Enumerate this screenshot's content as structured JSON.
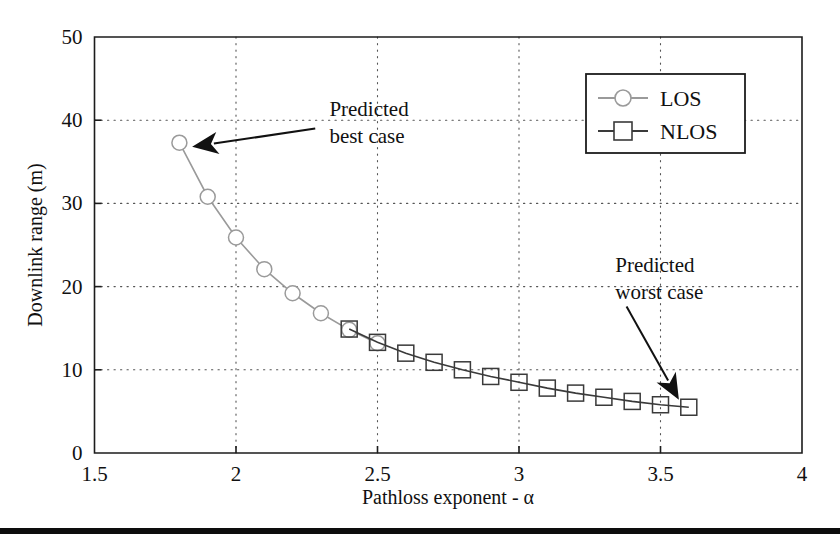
{
  "figure": {
    "background_color": "#ffffff",
    "frame_color": "#1c1c1c",
    "grid_color": "#565656",
    "footer_rule_color": "#0d0d0d"
  },
  "chart_data": {
    "type": "line",
    "title": "",
    "subtitle": "",
    "xlabel": "Pathloss exponent - α",
    "ylabel": "Downlink range (m)",
    "xlim": [
      1.5,
      4
    ],
    "ylim": [
      0,
      50
    ],
    "xticks": [
      1.5,
      2,
      2.5,
      3,
      3.5,
      4
    ],
    "xticklabels": [
      "1.5",
      "2",
      "2.5",
      "3",
      "3.5",
      "4"
    ],
    "yticks": [
      0,
      10,
      20,
      30,
      40,
      50
    ],
    "yticklabels": [
      "0",
      "10",
      "20",
      "30",
      "40",
      "50"
    ],
    "grid": true,
    "grid_style": "dotted",
    "legend_position": "upper-right",
    "series": [
      {
        "name": "LOS",
        "marker": "circle",
        "color": "#9a9a9a",
        "x": [
          1.8,
          1.9,
          2.0,
          2.1,
          2.2,
          2.3,
          2.4,
          2.5
        ],
        "values": [
          37.3,
          30.8,
          25.9,
          22.1,
          19.2,
          16.8,
          14.8,
          13.2
        ]
      },
      {
        "name": "NLOS",
        "marker": "square",
        "color": "#3a3a3a",
        "x": [
          2.4,
          2.5,
          2.6,
          2.7,
          2.8,
          2.9,
          3.0,
          3.1,
          3.2,
          3.3,
          3.4,
          3.5,
          3.6
        ],
        "values": [
          14.9,
          13.3,
          12.0,
          10.9,
          10.0,
          9.2,
          8.5,
          7.8,
          7.2,
          6.7,
          6.2,
          5.8,
          5.5
        ]
      }
    ],
    "annotations": [
      {
        "id": "best-case",
        "text_line1": "Predicted",
        "text_line2": "best case",
        "text_x": 2.33,
        "text_y": 40.5,
        "arrow_from_x": 2.28,
        "arrow_from_y": 39.0,
        "arrow_to_x": 1.845,
        "arrow_to_y": 36.8
      },
      {
        "id": "worst-case",
        "text_line1": "Predicted",
        "text_line2": "worst case",
        "text_x": 3.34,
        "text_y": 21.7,
        "arrow_from_x": 3.38,
        "arrow_from_y": 17.6,
        "arrow_to_x": 3.565,
        "arrow_to_y": 6.4
      }
    ]
  },
  "legend": {
    "items": [
      {
        "label": "LOS",
        "marker": "circle",
        "color": "#9a9a9a"
      },
      {
        "label": "NLOS",
        "marker": "square",
        "color": "#3a3a3a"
      }
    ]
  }
}
